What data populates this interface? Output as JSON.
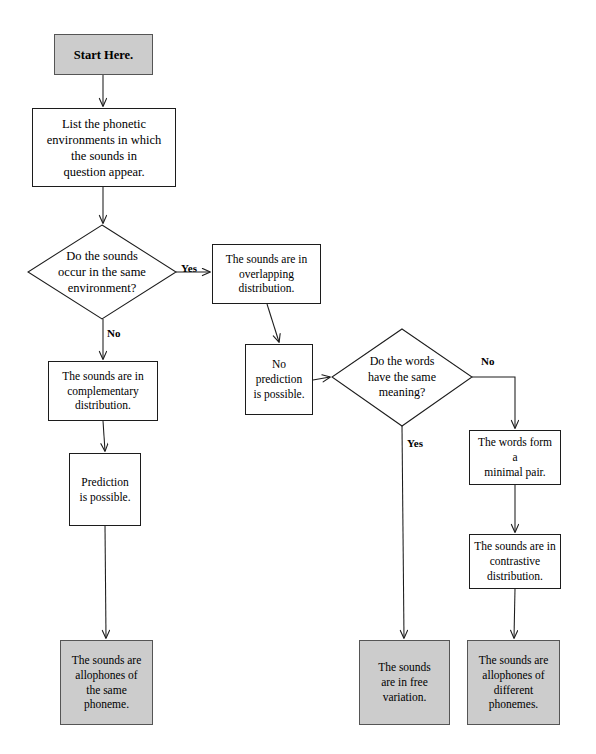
{
  "diagram": {
    "type": "flowchart",
    "canvas": {
      "width": 596,
      "height": 754
    },
    "colors": {
      "terminal_fill": "#cccccc",
      "process_fill": "#ffffff",
      "stroke": "#1c1c1c",
      "text": "#000000"
    },
    "nodes": [
      {
        "id": "start",
        "shape": "terminal",
        "text": "Start Here.",
        "x": 54,
        "y": 34,
        "w": 99,
        "h": 41
      },
      {
        "id": "list-environments",
        "shape": "process",
        "text": "List the phonetic\nenvironments in which\nthe sounds in\nquestion appear.",
        "x": 32,
        "y": 108,
        "w": 144,
        "h": 79
      },
      {
        "id": "same-environment-question",
        "shape": "decision",
        "text": "Do the sounds\noccur in the same\nenvironment?",
        "x": 28,
        "y": 225,
        "w": 148,
        "h": 94
      },
      {
        "id": "overlapping-distribution",
        "shape": "process",
        "text": "The sounds are in\noverlapping\ndistribution.",
        "x": 212,
        "y": 244,
        "w": 109,
        "h": 60
      },
      {
        "id": "complementary-distribution",
        "shape": "process",
        "text": "The sounds are in\ncomplementary\ndistribution.",
        "x": 48,
        "y": 361,
        "w": 110,
        "h": 60
      },
      {
        "id": "no-prediction",
        "shape": "process",
        "text": "No\nprediction\nis possible.",
        "x": 245,
        "y": 344,
        "w": 68,
        "h": 71
      },
      {
        "id": "same-meaning-question",
        "shape": "decision",
        "text": "Do the words\nhave the same\nmeaning?",
        "x": 332,
        "y": 329,
        "w": 140,
        "h": 97
      },
      {
        "id": "prediction-possible",
        "shape": "process",
        "text": "Prediction\nis possible.",
        "x": 69,
        "y": 453,
        "w": 72,
        "h": 73
      },
      {
        "id": "minimal-pair",
        "shape": "process",
        "text": "The words form a\nminimal pair.",
        "x": 469,
        "y": 430,
        "w": 92,
        "h": 55
      },
      {
        "id": "contrastive-distribution",
        "shape": "process",
        "text": "The sounds are in\ncontrastive\ndistribution.",
        "x": 469,
        "y": 534,
        "w": 92,
        "h": 55
      },
      {
        "id": "allophones-same-phoneme",
        "shape": "terminal",
        "text": "The sounds are\nallophones of\nthe same\nphoneme.",
        "x": 60,
        "y": 640,
        "w": 93,
        "h": 85
      },
      {
        "id": "free-variation",
        "shape": "terminal",
        "text": "The sounds\nare in free\nvariation.",
        "x": 359,
        "y": 640,
        "w": 91,
        "h": 85
      },
      {
        "id": "allophones-different-phonemes",
        "shape": "terminal",
        "text": "The sounds are\nallophones of\ndifferent\nphonemes.",
        "x": 467,
        "y": 640,
        "w": 93,
        "h": 85
      }
    ],
    "edge_labels": [
      {
        "id": "yes-overlapping",
        "text": "Yes",
        "x": 181,
        "y": 262
      },
      {
        "id": "no-complementary",
        "text": "No",
        "x": 107,
        "y": 327
      },
      {
        "id": "no-minimal-pair",
        "text": "No",
        "x": 481,
        "y": 355
      },
      {
        "id": "yes-free-variation",
        "text": "Yes",
        "x": 407,
        "y": 437
      }
    ],
    "edges": [
      {
        "from": "start",
        "to": "list-environments"
      },
      {
        "from": "list-environments",
        "to": "same-environment-question"
      },
      {
        "from": "same-environment-question",
        "to": "overlapping-distribution",
        "label": "Yes"
      },
      {
        "from": "same-environment-question",
        "to": "complementary-distribution",
        "label": "No"
      },
      {
        "from": "overlapping-distribution",
        "to": "no-prediction"
      },
      {
        "from": "no-prediction",
        "to": "same-meaning-question"
      },
      {
        "from": "complementary-distribution",
        "to": "prediction-possible"
      },
      {
        "from": "prediction-possible",
        "to": "allophones-same-phoneme"
      },
      {
        "from": "same-meaning-question",
        "to": "free-variation",
        "label": "Yes"
      },
      {
        "from": "same-meaning-question",
        "to": "minimal-pair",
        "label": "No"
      },
      {
        "from": "minimal-pair",
        "to": "contrastive-distribution"
      },
      {
        "from": "contrastive-distribution",
        "to": "allophones-different-phonemes"
      }
    ]
  }
}
